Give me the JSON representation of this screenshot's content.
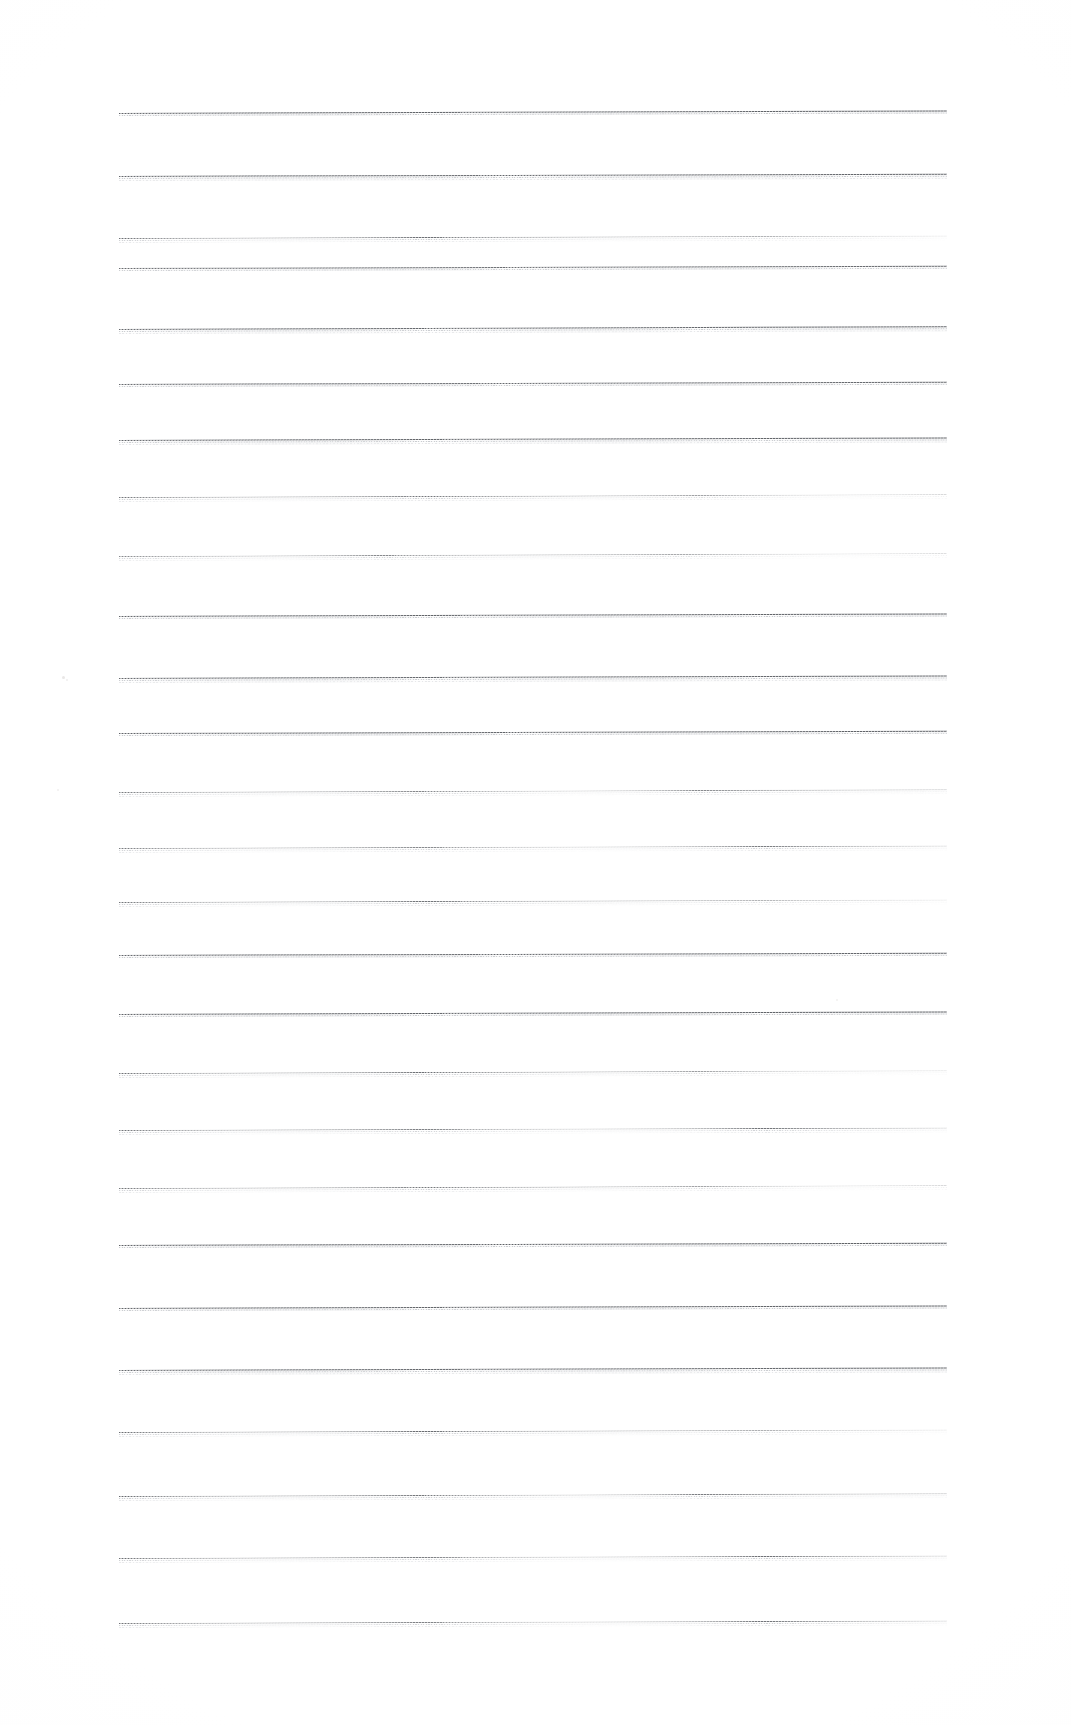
{
  "document": {
    "kind": "scanned-lined-paper",
    "title": "Blank Ruled Notebook Page",
    "page_width": 1071,
    "page_height": 1725,
    "background_color": "#ffffff",
    "line_color": "#5a5d62",
    "echo_color": "#c9cbcf",
    "text_content": "",
    "handwriting": "",
    "annotations": [],
    "ruling": {
      "style": "horizontal-ruled",
      "line_count": 25,
      "first_line_y": 113,
      "line_spacing": 62.9,
      "line_left_x": 119,
      "line_right_x": 947,
      "line_length": 828,
      "line_thickness": 1.15,
      "tilt_degrees": -0.18
    },
    "lines": [
      {
        "index": 1,
        "y": 113,
        "opacity": 0.96,
        "tilt": -0.17,
        "fade": "none",
        "echo2": false
      },
      {
        "index": 2,
        "y": 176,
        "opacity": 0.94,
        "tilt": -0.16,
        "fade": "none",
        "echo2": true
      },
      {
        "index": 3,
        "y": 238,
        "opacity": 0.88,
        "tilt": -0.18,
        "fade": "right",
        "echo2": true
      },
      {
        "index": 4,
        "y": 268,
        "opacity": 0.9,
        "tilt": -0.15,
        "fade": "none",
        "echo2": false
      },
      {
        "index": 5,
        "y": 329,
        "opacity": 0.93,
        "tilt": -0.19,
        "fade": "none",
        "echo2": true
      },
      {
        "index": 6,
        "y": 384,
        "opacity": 0.92,
        "tilt": -0.16,
        "fade": "none",
        "echo2": false
      },
      {
        "index": 7,
        "y": 440,
        "opacity": 0.95,
        "tilt": -0.18,
        "fade": "none",
        "echo2": true
      },
      {
        "index": 8,
        "y": 497,
        "opacity": 0.84,
        "tilt": -0.2,
        "fade": "right",
        "echo2": true
      },
      {
        "index": 9,
        "y": 556,
        "opacity": 0.72,
        "tilt": -0.21,
        "fade": "right",
        "echo2": true
      },
      {
        "index": 10,
        "y": 616,
        "opacity": 0.95,
        "tilt": -0.17,
        "fade": "none",
        "echo2": false
      },
      {
        "index": 11,
        "y": 678,
        "opacity": 0.93,
        "tilt": -0.18,
        "fade": "none",
        "echo2": true
      },
      {
        "index": 12,
        "y": 733,
        "opacity": 0.96,
        "tilt": -0.15,
        "fade": "none",
        "echo2": false
      },
      {
        "index": 13,
        "y": 792,
        "opacity": 0.82,
        "tilt": -0.19,
        "fade": "mid",
        "echo2": true
      },
      {
        "index": 14,
        "y": 848,
        "opacity": 0.8,
        "tilt": -0.18,
        "fade": "mid",
        "echo2": true
      },
      {
        "index": 15,
        "y": 902,
        "opacity": 0.85,
        "tilt": -0.17,
        "fade": "right",
        "echo2": true
      },
      {
        "index": 16,
        "y": 955,
        "opacity": 0.94,
        "tilt": -0.16,
        "fade": "none",
        "echo2": false
      },
      {
        "index": 17,
        "y": 1014,
        "opacity": 0.96,
        "tilt": -0.18,
        "fade": "none",
        "echo2": false
      },
      {
        "index": 18,
        "y": 1073,
        "opacity": 0.88,
        "tilt": -0.19,
        "fade": "right",
        "echo2": true
      },
      {
        "index": 19,
        "y": 1130,
        "opacity": 0.86,
        "tilt": -0.17,
        "fade": "mid",
        "echo2": true
      },
      {
        "index": 20,
        "y": 1188,
        "opacity": 0.83,
        "tilt": -0.2,
        "fade": "right",
        "echo2": true
      },
      {
        "index": 21,
        "y": 1245,
        "opacity": 0.97,
        "tilt": -0.16,
        "fade": "none",
        "echo2": false
      },
      {
        "index": 22,
        "y": 1308,
        "opacity": 0.95,
        "tilt": -0.18,
        "fade": "none",
        "echo2": false
      },
      {
        "index": 23,
        "y": 1370,
        "opacity": 0.93,
        "tilt": -0.17,
        "fade": "none",
        "echo2": true
      },
      {
        "index": 24,
        "y": 1432,
        "opacity": 0.9,
        "tilt": -0.18,
        "fade": "right",
        "echo2": true
      },
      {
        "index": 25,
        "y": 1496,
        "opacity": 0.92,
        "tilt": -0.19,
        "fade": "mid",
        "echo2": true
      },
      {
        "index": 26,
        "y": 1558,
        "opacity": 0.88,
        "tilt": -0.17,
        "fade": "mid",
        "echo2": true
      },
      {
        "index": 27,
        "y": 1623,
        "opacity": 0.86,
        "tilt": -0.18,
        "fade": "mid",
        "echo2": true
      }
    ],
    "specks": [
      {
        "x": 62,
        "y": 676,
        "size": 3.2,
        "opacity": 0.55
      },
      {
        "x": 66,
        "y": 679,
        "size": 2.1,
        "opacity": 0.4
      },
      {
        "x": 57,
        "y": 789,
        "size": 2.4,
        "opacity": 0.38
      },
      {
        "x": 836,
        "y": 999,
        "size": 2.0,
        "opacity": 0.35
      }
    ]
  }
}
